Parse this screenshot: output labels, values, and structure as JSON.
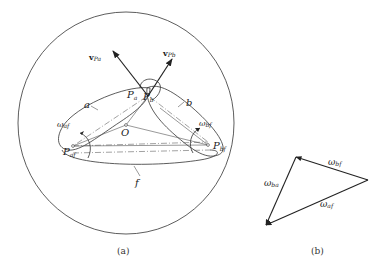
{
  "figure_a": {
    "caption": "(a)",
    "labels": {
      "v_pa": "v",
      "v_pa_sub": "Pa",
      "v_pb": "v",
      "v_pb_sub": "Pb",
      "p_a": "P",
      "p_a_sub": "a",
      "p_b": "P",
      "p_b_sub": "b",
      "body_a": "a",
      "body_b": "b",
      "body_f": "f",
      "origin": "O",
      "omega_af": "ω",
      "omega_af_sub": "af",
      "omega_bf": "ω",
      "omega_bf_sub": "bf",
      "p_af": "P",
      "p_af_sub": "af",
      "p_bf": "P",
      "p_bf_sub": "bf"
    }
  },
  "figure_b": {
    "caption": "(b)",
    "labels": {
      "omega_bf": "ω",
      "omega_bf_sub": "bf",
      "omega_ba": "ω",
      "omega_ba_sub": "ba",
      "omega_af": "ω",
      "omega_af_sub": "af"
    }
  },
  "colors": {
    "ink": "#333333",
    "background": "#ffffff"
  }
}
